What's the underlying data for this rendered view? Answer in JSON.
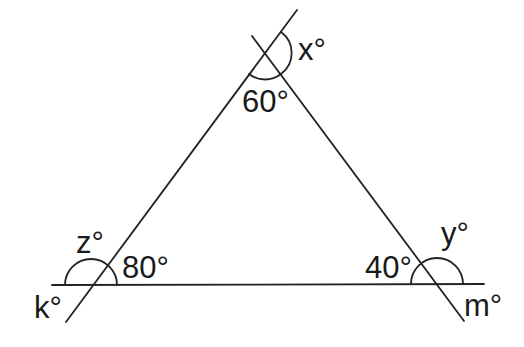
{
  "diagram": {
    "type": "triangle-angles",
    "colors": {
      "stroke": "#222222",
      "text": "#1a1a1a",
      "background": "#ffffff"
    },
    "lines": {
      "base": {
        "x1": 52,
        "y1": 285,
        "x2": 484,
        "y2": 284
      },
      "left_side": {
        "x1": 66,
        "y1": 322,
        "x2": 297,
        "y2": 10
      },
      "right_side": {
        "x1": 252,
        "y1": 36,
        "x2": 464,
        "y2": 321
      }
    },
    "vertices": {
      "top": {
        "x": 265,
        "y": 53
      },
      "bottom_left": {
        "x": 91,
        "y": 285
      },
      "bottom_right": {
        "x": 437,
        "y": 284
      }
    },
    "labels": {
      "top_interior": "60°",
      "top_exterior": "x°",
      "left_interior": "80°",
      "left_exterior_top": "z°",
      "left_exterior_bottom": "k°",
      "right_interior": "40°",
      "right_exterior_top": "y°",
      "right_exterior_bottom": "m°"
    }
  }
}
